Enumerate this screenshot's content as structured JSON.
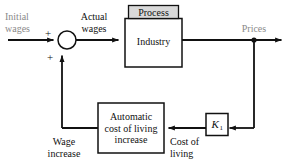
{
  "diagram": {
    "colors": {
      "line": "#111111",
      "muted_text": "#8a8a8a",
      "text": "#111111",
      "process_header_fill": "#d9d9d9",
      "block_fill": "#ffffff",
      "background": "#ffffff"
    },
    "signals": {
      "initial_wages": "Initial\nwages",
      "actual_wages": "Actual\nwages",
      "prices": "Prices",
      "wage_increase": "Wage\nincrease",
      "cost_of_living": "Cost of\nliving"
    },
    "summing_junction": {
      "name": "summing-junction",
      "sign_top": "+",
      "sign_bottom": "+"
    },
    "blocks": [
      {
        "id": "process",
        "header": "Process",
        "body": "Industry"
      },
      {
        "id": "automatic-cost-of-living-increase",
        "body": "Automatic\ncost of living\nincrease"
      },
      {
        "id": "gain",
        "symbol": "K",
        "subscript": "1"
      }
    ]
  }
}
